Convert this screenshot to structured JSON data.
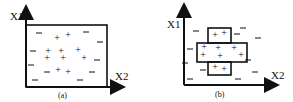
{
  "panels": [
    {
      "id": "a",
      "caption": "(a)",
      "y_axis_label": "X1",
      "x_axis_label": "X2",
      "plus": [
        [
          57,
          38
        ],
        [
          68,
          35
        ],
        [
          48,
          51
        ],
        [
          61,
          51
        ],
        [
          78,
          50
        ],
        [
          47,
          58
        ],
        [
          63,
          58
        ],
        [
          84,
          58
        ],
        [
          58,
          70
        ],
        [
          68,
          72
        ]
      ],
      "minus": [
        [
          39,
          33
        ],
        [
          86,
          32
        ],
        [
          100,
          42
        ],
        [
          33,
          51
        ],
        [
          97,
          60
        ],
        [
          31,
          65
        ],
        [
          47,
          72
        ],
        [
          92,
          72
        ],
        [
          35,
          80
        ],
        [
          80,
          80
        ]
      ]
    },
    {
      "id": "b",
      "caption": "(b)",
      "y_axis_label": "X1",
      "x_axis_label": "X2",
      "plus": [
        [
          215,
          35
        ],
        [
          224,
          33
        ],
        [
          204,
          47
        ],
        [
          218,
          48
        ],
        [
          234,
          48
        ],
        [
          203,
          55
        ],
        [
          220,
          56
        ],
        [
          241,
          55
        ],
        [
          215,
          67
        ],
        [
          224,
          69
        ]
      ],
      "minus": [
        [
          196,
          31
        ],
        [
          243,
          28
        ],
        [
          237,
          34
        ],
        [
          258,
          38
        ],
        [
          190,
          49
        ],
        [
          185,
          63
        ],
        [
          203,
          70
        ],
        [
          248,
          60
        ],
        [
          255,
          72
        ],
        [
          190,
          79
        ],
        [
          238,
          79
        ]
      ]
    }
  ]
}
